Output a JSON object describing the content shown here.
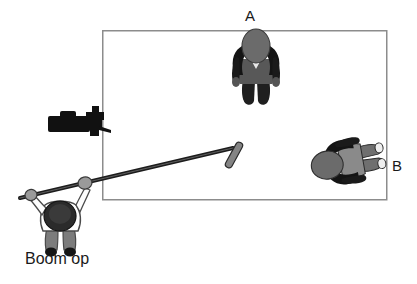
{
  "diagram": {
    "background_color": "#ffffff",
    "frame": {
      "name": "camera-frame-rectangle",
      "stroke_color": "#8c8c8c",
      "stroke_width": 1.5,
      "x": 102,
      "y": 30,
      "width": 285,
      "height": 170
    },
    "labels": {
      "actor_a": "A",
      "actor_b": "B",
      "boom_operator": "Boom op"
    },
    "actors": [
      {
        "id": "A",
        "label": "A",
        "description": "actor seen from above, facing camera",
        "x": 256,
        "y": 65,
        "rotation_deg": 0,
        "head_color": "#6b6b6b",
        "body_color": "#1a1a1a",
        "torso_color": "#585858"
      },
      {
        "id": "B",
        "label": "B",
        "description": "actor seen from above, rotated facing left",
        "x": 345,
        "y": 162,
        "rotation_deg": -100,
        "head_color": "#6b6b6b",
        "body_color": "#1a1a1a",
        "torso_color": "#8a8a8a"
      }
    ],
    "camera": {
      "name": "film-camera",
      "description": "camera silhouette at frame left edge pointing right",
      "x": 48,
      "y": 110,
      "width": 62,
      "height": 26,
      "color": "#111111"
    },
    "boom": {
      "operator": {
        "name": "boom-operator-figure",
        "x": 63,
        "y": 222,
        "head_color": "#2b2b2b",
        "shirt_color": "#fdfdfd",
        "shorts_color": "#7c7c7c",
        "shoes_color": "#1a1a1a",
        "outline_color": "#4a4a4a"
      },
      "pole": {
        "name": "boom-pole",
        "x1": 20,
        "y1": 198,
        "x2": 232,
        "y2": 148,
        "color": "#1c1c1c",
        "width": 4
      },
      "microphone": {
        "name": "boom-microphone",
        "x": 236,
        "y": 152,
        "length": 26,
        "color": "#7e7e7e",
        "outline_color": "#2a2a2a",
        "angle_deg": 62
      },
      "grips": [
        {
          "name": "grip-left-hand",
          "x": 32,
          "y": 196
        },
        {
          "name": "grip-right-hand",
          "x": 83,
          "y": 184
        }
      ]
    },
    "colors": {
      "ink": "#1a1a1a",
      "frame_line": "#8c8c8c",
      "dark_fill": "#1a1a1a",
      "mid_gray": "#6b6b6b",
      "light_gray": "#bdbdbd",
      "white": "#ffffff"
    }
  }
}
